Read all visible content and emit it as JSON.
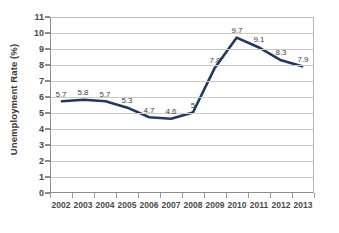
{
  "chart_data": {
    "type": "line",
    "title": "",
    "xlabel": "",
    "ylabel": "Unemployment Rate (%)",
    "categories": [
      "2002",
      "2003",
      "2004",
      "2005",
      "2006",
      "2007",
      "2008",
      "2009",
      "2010",
      "2011",
      "2012",
      "2013"
    ],
    "values": [
      5.7,
      5.8,
      5.7,
      5.3,
      4.7,
      4.6,
      5,
      7.8,
      9.7,
      9.1,
      8.3,
      7.9
    ],
    "point_labels": [
      "5.7",
      "5.8",
      "5.7",
      "5.3",
      "4.7",
      "4.6",
      "5",
      "7.8",
      "9.7",
      "9.1",
      "8.3",
      "7.9"
    ],
    "ylim": [
      0,
      11
    ],
    "ytick_step": 1,
    "ytick_labels": [
      "0",
      "1",
      "2",
      "3",
      "4",
      "5",
      "6",
      "7",
      "8",
      "9",
      "10",
      "11"
    ],
    "grid": true,
    "legend": false,
    "series_color": "#1f3864",
    "grid_color": "#c9c9c9",
    "axis_color": "#8d8d8d",
    "label_color": "#4a4a4a",
    "background": "#ffffff"
  }
}
